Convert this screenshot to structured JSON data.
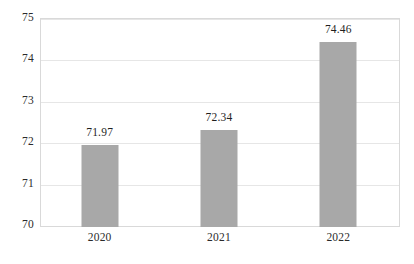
{
  "chart_data": {
    "type": "bar",
    "title": "",
    "subtitle": "",
    "xlabel": "",
    "ylabel": "",
    "categories": [
      "2020",
      "2021",
      "2022"
    ],
    "values": [
      71.97,
      72.34,
      74.46
    ],
    "data_labels": [
      "71.97",
      "72.34",
      "74.46"
    ],
    "series": [
      {
        "name": "",
        "values": [
          71.97,
          72.34,
          74.46
        ],
        "color": "#a8a8a8"
      }
    ],
    "ylim": [
      70,
      75
    ],
    "yticks": [
      70,
      71,
      72,
      73,
      74,
      75
    ],
    "ytick_labels": [
      "70",
      "71",
      "72",
      "73",
      "74",
      "75"
    ],
    "grid": true,
    "grid_axis": "y",
    "legend": false,
    "legend_position": "none",
    "annotations": []
  },
  "style": {
    "background": "#ffffff",
    "bar_color": "#a8a8a8",
    "gridline_color": "#e6e6e6",
    "axis_border_color": "#d9d9d9",
    "label_color": "#2b2b2b",
    "value_label_color": "#1f1f1f"
  }
}
